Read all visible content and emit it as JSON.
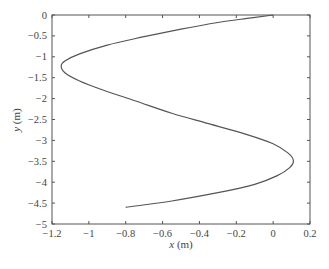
{
  "chart_data": {
    "type": "line",
    "title": "",
    "xlabel_var": "x",
    "xlabel_unit": " (m)",
    "ylabel_var": "y",
    "ylabel_unit": " (m)",
    "xlabel": "x (m)",
    "ylabel": "y (m)",
    "xlim": [
      -1.2,
      0.2
    ],
    "ylim": [
      -5,
      0
    ],
    "grid": false,
    "legend": null,
    "x_ticks": [
      -1.2,
      -1,
      -0.8,
      -0.6,
      -0.4,
      -0.2,
      0,
      0.2
    ],
    "x_tick_labels": [
      "−1.2",
      "−1",
      "−0.8",
      "−0.6",
      "−0.4",
      "−0.2",
      "0",
      "0.2"
    ],
    "y_ticks": [
      0,
      -0.5,
      -1,
      -1.5,
      -2,
      -2.5,
      -3,
      -3.5,
      -4,
      -4.5,
      -5
    ],
    "y_tick_labels": [
      "0",
      "−0.5",
      "−1",
      "−1.5",
      "−2",
      "−2.5",
      "−3",
      "−3.5",
      "−4",
      "−4.5",
      "−5"
    ],
    "series": [
      {
        "name": "trajectory",
        "color": "#555555",
        "points": [
          [
            0.0,
            0.0
          ],
          [
            -0.12,
            -0.07
          ],
          [
            -0.3,
            -0.18
          ],
          [
            -0.5,
            -0.34
          ],
          [
            -0.7,
            -0.52
          ],
          [
            -0.9,
            -0.72
          ],
          [
            -1.05,
            -0.93
          ],
          [
            -1.13,
            -1.1
          ],
          [
            -1.15,
            -1.22
          ],
          [
            -1.13,
            -1.38
          ],
          [
            -1.05,
            -1.58
          ],
          [
            -0.92,
            -1.8
          ],
          [
            -0.75,
            -2.05
          ],
          [
            -0.55,
            -2.35
          ],
          [
            -0.35,
            -2.6
          ],
          [
            -0.15,
            -2.85
          ],
          [
            0.0,
            -3.08
          ],
          [
            0.08,
            -3.3
          ],
          [
            0.11,
            -3.48
          ],
          [
            0.09,
            -3.65
          ],
          [
            0.02,
            -3.85
          ],
          [
            -0.1,
            -4.05
          ],
          [
            -0.3,
            -4.25
          ],
          [
            -0.55,
            -4.45
          ],
          [
            -0.8,
            -4.6
          ]
        ]
      }
    ]
  }
}
